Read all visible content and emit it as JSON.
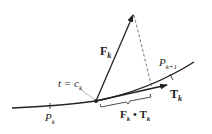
{
  "diagram": {
    "colors": {
      "ink": "#222222",
      "dashed": "#555555",
      "background": "#ffffff"
    },
    "labels": {
      "force": {
        "main": "F",
        "sub": "k"
      },
      "tangent": {
        "main": "T",
        "sub": "k"
      },
      "param": {
        "prefix": "t = c",
        "sub": "k"
      },
      "p_k": {
        "main": "P",
        "sub": "k"
      },
      "p_k1": {
        "main": "P",
        "sub": "k+1"
      },
      "dot": {
        "a": "F",
        "asub": "k",
        "op": " • ",
        "b": "T",
        "bsub": "k"
      }
    }
  }
}
